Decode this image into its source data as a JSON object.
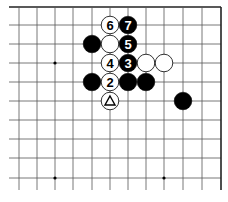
{
  "diagram": {
    "type": "go-board-fragment",
    "grid": {
      "columns_x": [
        19,
        37,
        55,
        73,
        92,
        110,
        128,
        146,
        164,
        183,
        202,
        221
      ],
      "rows_y": [
        7,
        25,
        44,
        63,
        82,
        101,
        120,
        139,
        158,
        178
      ],
      "left_extent": 9,
      "bottom_extent": 190,
      "top_edge": true,
      "right_edge": true
    },
    "star_points": [
      {
        "x": 55,
        "y": 63
      },
      {
        "x": 55,
        "y": 178
      },
      {
        "x": 164,
        "y": 178
      }
    ],
    "stones": [
      {
        "color": "white",
        "x": 110,
        "y": 25,
        "label": "6"
      },
      {
        "color": "black",
        "x": 128,
        "y": 25,
        "label": "7"
      },
      {
        "color": "black",
        "x": 92,
        "y": 44,
        "label": ""
      },
      {
        "color": "white",
        "x": 110,
        "y": 44,
        "label": ""
      },
      {
        "color": "black",
        "x": 128,
        "y": 44,
        "label": "5"
      },
      {
        "color": "white",
        "x": 110,
        "y": 63,
        "label": "4"
      },
      {
        "color": "black",
        "x": 128,
        "y": 63,
        "label": "3"
      },
      {
        "color": "white",
        "x": 146,
        "y": 63,
        "label": ""
      },
      {
        "color": "white",
        "x": 164,
        "y": 63,
        "label": ""
      },
      {
        "color": "black",
        "x": 92,
        "y": 82,
        "label": ""
      },
      {
        "color": "white",
        "x": 110,
        "y": 82,
        "label": "2"
      },
      {
        "color": "black",
        "x": 128,
        "y": 82,
        "label": ""
      },
      {
        "color": "black",
        "x": 146,
        "y": 82,
        "label": ""
      },
      {
        "color": "white",
        "x": 110,
        "y": 101,
        "label": "△"
      },
      {
        "color": "black",
        "x": 183,
        "y": 101,
        "label": ""
      }
    ],
    "colors": {
      "grid": "#555555",
      "edge": "#222222",
      "black_stone": "#000000",
      "white_stone": "#ffffff",
      "stone_outline": "#000000"
    },
    "caption": ""
  }
}
